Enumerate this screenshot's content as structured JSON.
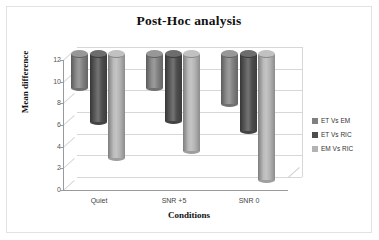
{
  "chart_data": {
    "type": "bar",
    "title": "Post-Hoc analysis",
    "xlabel": "Conditions",
    "ylabel": "Mean difference",
    "categories": [
      "Quiet",
      "SNR +5",
      "SNR 0"
    ],
    "series": [
      {
        "name": "ET Vs EM",
        "values": [
          3.0,
          3.0,
          4.5
        ],
        "color": "#808080"
      },
      {
        "name": "ET Vs RIC",
        "values": [
          6.2,
          6.1,
          7.0
        ],
        "color": "#4d4d4d"
      },
      {
        "name": "EM Vs RIC",
        "values": [
          9.5,
          8.9,
          11.5
        ],
        "color": "#b3b3b3"
      }
    ],
    "ylim": [
      0,
      12
    ],
    "yticks": [
      "12",
      "10",
      "8",
      "6",
      "4",
      "2",
      "0"
    ],
    "ytick_values": [
      12,
      10,
      8,
      6,
      4,
      2,
      0
    ],
    "grid": true,
    "legend_position": "right",
    "style": "3d-cylinder"
  }
}
